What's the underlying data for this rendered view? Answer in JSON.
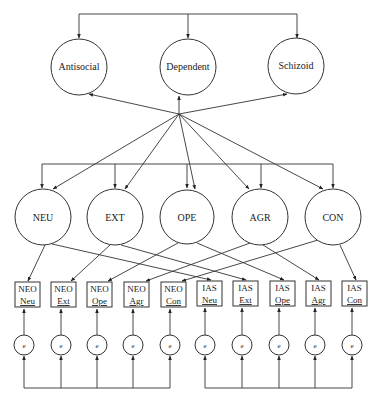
{
  "diagram": {
    "type": "structural-equation-model",
    "higher_order": [
      {
        "id": "antisocial",
        "label": "Antisocial",
        "cx": 79,
        "cy": 67,
        "r": 28
      },
      {
        "id": "dependent",
        "label": "Dependent",
        "cx": 188,
        "cy": 67,
        "r": 28
      },
      {
        "id": "schizoid",
        "label": "Schizoid",
        "cx": 296,
        "cy": 66,
        "r": 28
      }
    ],
    "factors": [
      {
        "id": "neu",
        "label": "NEU",
        "cx": 43,
        "cy": 217,
        "r": 28
      },
      {
        "id": "ext",
        "label": "EXT",
        "cx": 115,
        "cy": 217,
        "r": 28
      },
      {
        "id": "ope",
        "label": "OPE",
        "cx": 187,
        "cy": 217,
        "r": 28
      },
      {
        "id": "agr",
        "label": "AGR",
        "cx": 260,
        "cy": 217,
        "r": 28
      },
      {
        "id": "con",
        "label": "CON",
        "cx": 333,
        "cy": 217,
        "r": 28
      }
    ],
    "indicators": [
      {
        "id": "neo-neu",
        "line1": "NEO",
        "line2": "Neu",
        "x": 15,
        "factor": "neu"
      },
      {
        "id": "neo-ext",
        "line1": "NEO",
        "line2": "Ext",
        "x": 51,
        "factor": "ext"
      },
      {
        "id": "neo-ope",
        "line1": "NEO",
        "line2": "Ope",
        "x": 87,
        "factor": "ope"
      },
      {
        "id": "neo-agr",
        "line1": "NEO",
        "line2": "Agr",
        "x": 124,
        "factor": "agr"
      },
      {
        "id": "neo-con",
        "line1": "NEO",
        "line2": "Con",
        "x": 161,
        "factor": "con"
      },
      {
        "id": "ias-neu",
        "line1": "IAS",
        "line2": "Neu",
        "x": 197,
        "factor": "neu"
      },
      {
        "id": "ias-ext",
        "line1": "IAS",
        "line2": "Ext",
        "x": 233,
        "factor": "ext"
      },
      {
        "id": "ias-ope",
        "line1": "IAS",
        "line2": "Ope",
        "x": 270,
        "factor": "ope"
      },
      {
        "id": "ias-agr",
        "line1": "IAS",
        "line2": "Agr",
        "x": 306,
        "factor": "agr"
      },
      {
        "id": "ias-con",
        "line1": "IAS",
        "line2": "Con",
        "x": 342,
        "factor": "con"
      }
    ],
    "error_label": "e",
    "error_x": [
      24,
      61,
      97,
      133,
      170,
      205,
      242,
      279,
      315,
      352
    ]
  }
}
